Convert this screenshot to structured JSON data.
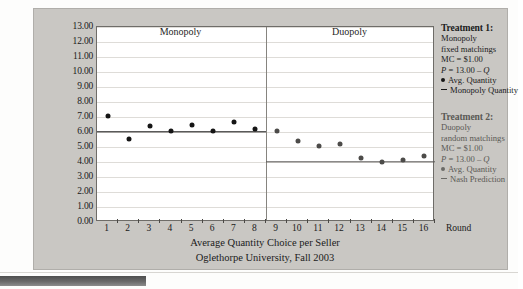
{
  "chart_data": {
    "type": "scatter",
    "title": "Average Quantity Choice per Seller",
    "subtitle": "Oglethorpe University, Fall 2003",
    "xlabel": "Round",
    "ylabel": "",
    "xlim": [
      0.5,
      16.5
    ],
    "ylim": [
      0.0,
      13.0
    ],
    "grid": true,
    "legend_position": "right",
    "x": [
      1,
      2,
      3,
      4,
      5,
      6,
      7,
      8,
      9,
      10,
      11,
      12,
      13,
      14,
      15,
      16
    ],
    "ytick_labels": [
      "13.00",
      "12.00",
      "11.00",
      "10.00",
      "9.00",
      "8.00",
      "7.00",
      "6.00",
      "5.00",
      "4.00",
      "3.00",
      "2.00",
      "1.00",
      "0.00"
    ],
    "ytick_values": [
      13,
      12,
      11,
      10,
      9,
      8,
      7,
      6,
      5,
      4,
      3,
      2,
      1,
      0
    ],
    "xtick_labels": [
      "1",
      "2",
      "3",
      "4",
      "5",
      "6",
      "7",
      "8",
      "9",
      "10",
      "11",
      "12",
      "13",
      "14",
      "15",
      "16"
    ],
    "region_titles": [
      {
        "label": "Monopoly",
        "from_round": 1,
        "to_round": 8
      },
      {
        "label": "Duopoly",
        "from_round": 9,
        "to_round": 16
      }
    ],
    "divider_after_round": 8,
    "series": [
      {
        "name": "Avg. Quantity (Monopoly)",
        "marker": "filled-circle",
        "color": "#151515",
        "x": [
          1,
          2,
          3,
          4,
          5,
          6,
          7,
          8
        ],
        "values": [
          7.1,
          5.55,
          6.4,
          6.05,
          6.5,
          6.1,
          6.65,
          6.2
        ]
      },
      {
        "name": "Avg. Quantity (Duopoly)",
        "marker": "filled-circle",
        "color": "#4c4b49",
        "x": [
          9,
          10,
          11,
          12,
          13,
          14,
          15,
          16
        ],
        "values": [
          6.1,
          5.4,
          5.1,
          5.2,
          4.3,
          4.0,
          4.15,
          4.4
        ]
      }
    ],
    "reference_lines": [
      {
        "name": "Monopoly Quantity",
        "value": 6.0,
        "from_round": 1,
        "to_round": 8,
        "color": "#141414"
      },
      {
        "name": "Nash Prediction",
        "value": 4.0,
        "from_round": 9,
        "to_round": 16,
        "color": "#595856"
      }
    ]
  },
  "legend": {
    "treatment1": {
      "heading": "Treatment 1:",
      "line1": "Monopoly",
      "line2": "fixed matchings",
      "line3": "MC = $1.00",
      "line4_p": "P",
      "line4_rest": " = 13.00 – ",
      "line4_q": "Q",
      "marker_series": "Avg. Quantity",
      "marker_line": "Monopoly Quantity"
    },
    "treatment2": {
      "heading": "Treatment 2:",
      "line1": "Duopoly",
      "line2": "random matchings",
      "line3": "MC = $1.00",
      "line4_p": "P",
      "line4_rest": " = 13.00 – ",
      "line4_q": "Q",
      "marker_series": "Avg. Quantity",
      "marker_line": "Nash Prediction"
    }
  },
  "colors": {
    "panel": "#c9c7c3",
    "plot_background": "#ffffff",
    "gridline": "#dedcd8",
    "monopoly_marker": "#151515",
    "duopoly_marker": "#4c4b49"
  }
}
